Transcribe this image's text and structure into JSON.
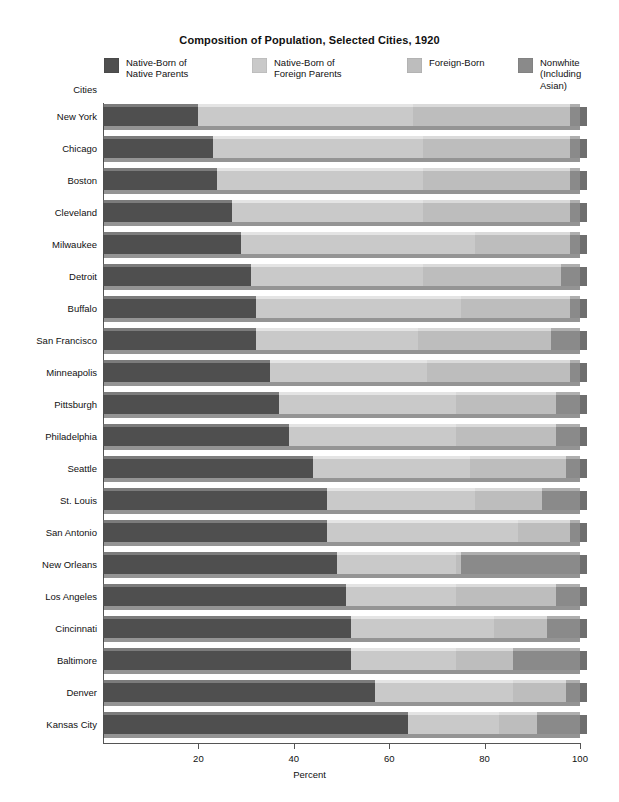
{
  "title": "Composition of Population, Selected Cities, 1920",
  "axis": {
    "y_title": "Cities",
    "x_title": "Percent",
    "x_ticks": [
      20,
      40,
      60,
      80,
      100
    ],
    "x_tick_labels": [
      "20",
      "40",
      "60",
      "80",
      "100"
    ],
    "xlim": [
      0,
      100
    ]
  },
  "legend": {
    "position": "top",
    "items": [
      {
        "label": "Native-Born of\nNative Parents",
        "color": "#4f4f4f"
      },
      {
        "label": "Native-Born of\nForeign Parents",
        "color": "#c9c9c9"
      },
      {
        "label": "Foreign-Born",
        "color": "#bdbdbd"
      },
      {
        "label": "Nonwhite\n(Including Asian)",
        "color": "#8a8a8a"
      }
    ]
  },
  "chart_data": {
    "type": "bar",
    "orientation": "horizontal",
    "stacked": true,
    "title": "Composition of Population, Selected Cities, 1920",
    "xlabel": "Percent",
    "ylabel": "Cities",
    "xlim": [
      0,
      100
    ],
    "grid": false,
    "legend_position": "top",
    "series": [
      {
        "name": "Native-Born of Native Parents",
        "color": "#4f4f4f",
        "values": [
          20,
          23,
          24,
          27,
          29,
          31,
          32,
          32,
          35,
          37,
          39,
          44,
          47,
          47,
          49,
          51,
          52,
          52,
          57,
          64
        ]
      },
      {
        "name": "Native-Born of Foreign Parents",
        "color": "#c9c9c9",
        "values": [
          45,
          44,
          43,
          40,
          49,
          36,
          43,
          34,
          33,
          37,
          35,
          33,
          31,
          40,
          25,
          23,
          30,
          22,
          29,
          19
        ]
      },
      {
        "name": "Foreign-Born",
        "color": "#bdbdbd",
        "values": [
          33,
          31,
          31,
          31,
          20,
          29,
          23,
          28,
          30,
          21,
          21,
          20,
          14,
          11,
          1,
          21,
          11,
          12,
          11,
          8
        ]
      },
      {
        "name": "Nonwhite (Including Asian)",
        "color": "#8a8a8a",
        "values": [
          2,
          2,
          2,
          2,
          2,
          4,
          2,
          6,
          2,
          5,
          5,
          3,
          8,
          2,
          25,
          5,
          7,
          14,
          3,
          9
        ]
      }
    ],
    "categories": [
      "New York",
      "Chicago",
      "Boston",
      "Cleveland",
      "Milwaukee",
      "Detroit",
      "Buffalo",
      "San Francisco",
      "Minneapolis",
      "Pittsburgh",
      "Philadelphia",
      "Seattle",
      "St. Louis",
      "San Antonio",
      "New Orleans",
      "Los Angeles",
      "Cincinnati",
      "Baltimore",
      "Denver",
      "Kansas City"
    ]
  }
}
